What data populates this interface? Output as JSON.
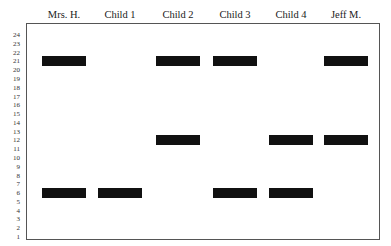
{
  "lanes": [
    {
      "label": "Mrs. H.",
      "bands": [
        21,
        6
      ]
    },
    {
      "label": "Child 1",
      "bands": [
        6
      ]
    },
    {
      "label": "Child 2",
      "bands": [
        21,
        12
      ]
    },
    {
      "label": "Child 3",
      "bands": [
        21,
        6
      ]
    },
    {
      "label": "Child 4",
      "bands": [
        12,
        6
      ]
    },
    {
      "label": "Jeff M.",
      "bands": [
        21,
        12
      ]
    }
  ],
  "y_axis": {
    "ticks": [
      "24",
      "23",
      "22",
      "21",
      "20",
      "19",
      "18",
      "17",
      "16",
      "15",
      "14",
      "13",
      "12",
      "11",
      "10",
      "9",
      "8",
      "7",
      "6",
      "5",
      "4",
      "3",
      "2",
      "1"
    ]
  },
  "colors": {
    "band": "#111111",
    "frame": "#555555"
  }
}
